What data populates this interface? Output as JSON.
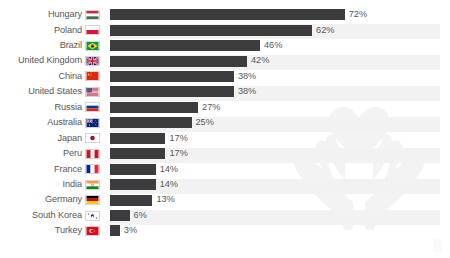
{
  "chart_data": {
    "type": "bar",
    "orientation": "horizontal",
    "title": "",
    "subtitle": "",
    "xlabel": "",
    "ylabel": "",
    "xlim": [
      0,
      100
    ],
    "grid": false,
    "legend": null,
    "value_suffix": "%",
    "categories": [
      "Hungary",
      "Poland",
      "Brazil",
      "United Kingdom",
      "China",
      "United States",
      "Russia",
      "Australia",
      "Japan",
      "Peru",
      "France",
      "India",
      "Germany",
      "South Korea",
      "Turkey"
    ],
    "values": [
      72,
      62,
      46,
      42,
      38,
      38,
      27,
      25,
      17,
      17,
      14,
      14,
      13,
      6,
      3
    ],
    "value_labels": [
      "72%",
      "62%",
      "46%",
      "42%",
      "38%",
      "38%",
      "27%",
      "25%",
      "17%",
      "17%",
      "14%",
      "14%",
      "13%",
      "6%",
      "3%"
    ],
    "flags": [
      "flag-hungary",
      "flag-poland",
      "flag-brazil",
      "flag-united-kingdom",
      "flag-china",
      "flag-united-states",
      "flag-russia",
      "flag-australia",
      "flag-japan",
      "flag-peru",
      "flag-france",
      "flag-india",
      "flag-germany",
      "flag-south-korea",
      "flag-turkey"
    ]
  },
  "style": {
    "bar_color": "#3c3c3e",
    "text_color": "#58585a",
    "stripe_color": "#f2f2f2",
    "background_color": "#ffffff",
    "watermark_color": "#f4f4f4"
  },
  "watermark": {
    "name": "hands-holding-heart-watermark"
  }
}
